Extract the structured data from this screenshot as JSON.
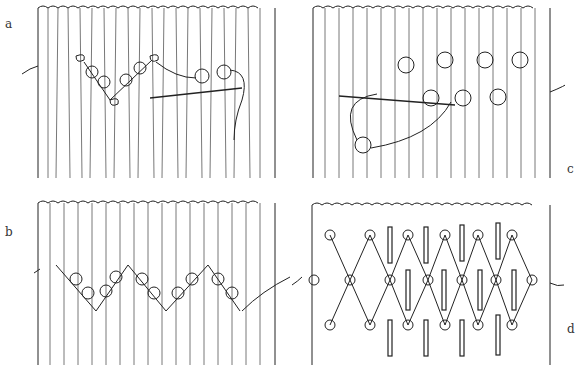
{
  "figure": {
    "ink_color": "#222222",
    "background": "#ffffff",
    "panels": [
      {
        "id": "a",
        "label": "a",
        "caption": "threading beads between pleat bundles with needle"
      },
      {
        "id": "b",
        "label": "b",
        "caption": "completed beaded zigzag row"
      },
      {
        "id": "c",
        "label": "c",
        "caption": "second row of beads worked with needle"
      },
      {
        "id": "d",
        "label": "d",
        "caption": "finished lattice of beads with inserted bars"
      }
    ]
  }
}
